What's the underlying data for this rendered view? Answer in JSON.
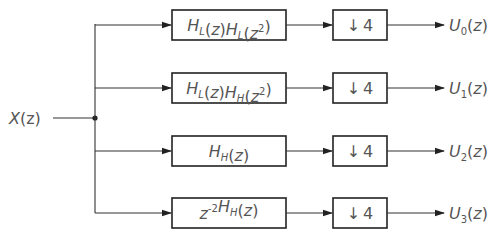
{
  "input": {
    "label": "X(z)",
    "base": "X",
    "arg": "(z)"
  },
  "branches": [
    {
      "filter": {
        "text": "H_L(z)H_L(z^2)",
        "parts": [
          {
            "t": "H",
            "s": "L"
          },
          {
            "t": "(z)"
          },
          {
            "t": "H",
            "s": "L"
          },
          {
            "t": "(z"
          },
          {
            "sup": "2"
          },
          {
            "t": ")"
          }
        ]
      },
      "downsample": {
        "arrow": "↓",
        "factor": "4"
      },
      "output": {
        "base": "U",
        "sub": "0",
        "arg": "(z)"
      }
    },
    {
      "filter": {
        "text": "H_L(z)H_H(z^2)",
        "parts": [
          {
            "t": "H",
            "s": "L"
          },
          {
            "t": "(z)"
          },
          {
            "t": "H",
            "s": "H"
          },
          {
            "t": "(z"
          },
          {
            "sup": "2"
          },
          {
            "t": ")"
          }
        ]
      },
      "downsample": {
        "arrow": "↓",
        "factor": "4"
      },
      "output": {
        "base": "U",
        "sub": "1",
        "arg": "(z)"
      }
    },
    {
      "filter": {
        "text": "H_H(z)",
        "parts": [
          {
            "t": "H",
            "s": "H"
          },
          {
            "t": "(z)"
          }
        ]
      },
      "downsample": {
        "arrow": "↓",
        "factor": "4"
      },
      "output": {
        "base": "U",
        "sub": "2",
        "arg": "(z)"
      }
    },
    {
      "filter": {
        "text": "z^-2 H_H(z)",
        "parts": [
          {
            "t": "z"
          },
          {
            "sup": "-2"
          },
          {
            "t": "H",
            "s": "H"
          },
          {
            "t": "(z)"
          }
        ]
      },
      "downsample": {
        "arrow": "↓",
        "factor": "4"
      },
      "output": {
        "base": "U",
        "sub": "3",
        "arg": "(z)"
      }
    }
  ],
  "colors": {
    "line": "#333333",
    "text": "#555555",
    "box_border": "#222222"
  }
}
